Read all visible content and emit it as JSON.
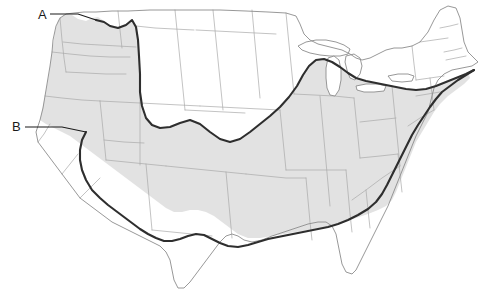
{
  "figure": {
    "kind": "reference-map",
    "region": "contiguous-united-states",
    "background_color": "#ffffff",
    "width": 489,
    "height": 303
  },
  "legend_labels": [
    {
      "id": "A",
      "text": "A",
      "text_x": 38,
      "text_y": 19,
      "leader": "M 50 14 L 78 14 L 96 20",
      "points_to": "northern-boundary-pacific-northwest"
    },
    {
      "id": "B",
      "text": "B",
      "text_x": 12,
      "text_y": 131,
      "leader": "M 25 127 L 62 127 L 86 132",
      "points_to": "western-boundary-california-coast"
    }
  ],
  "styles": {
    "land_fill": "#ffffff",
    "shaded_region_fill": "#e2e2e2",
    "state_border_color": "#a9a9a9",
    "state_border_width": 0.7,
    "coastline_color": "#8c8c8c",
    "coastline_width": 0.9,
    "boundary_line_color": "#2e2e2e",
    "boundary_line_width": 2.1,
    "lake_fill": "#ffffff",
    "label_color": "#1a1a1a",
    "leader_line_color": "#1a1a1a",
    "leader_line_width": 1.1
  },
  "map_features": {
    "outline_name": "contiguous-us-outline",
    "outline_path": "M 36 132 L 40 120 L 43 108 L 45 96 L 47 84 L 50 66 L 52 52 L 53 40 L 56 26 L 60 18 L 66 14 L 74 13 L 84 12 L 96 12 L 112 11 L 128 11 L 150 10 L 172 10 L 196 10 L 220 10 L 246 11 L 268 12 L 286 13 L 296 16 L 300 24 L 304 34 L 310 40 L 318 44 L 326 46 L 334 48 L 342 50 L 350 54 L 356 58 L 362 60 L 370 58 L 378 54 L 386 50 L 394 48 L 402 48 L 412 46 L 420 42 L 428 32 L 434 20 L 440 10 L 448 6 L 456 8 L 460 18 L 462 30 L 464 42 L 468 52 L 474 58 L 478 62 L 472 66 L 462 68 L 452 70 L 444 74 L 438 80 L 434 88 L 432 96 L 430 104 L 428 112 L 424 120 L 420 128 L 416 136 L 412 146 L 408 156 L 404 166 L 400 176 L 396 186 L 392 196 L 388 206 L 384 214 L 380 222 L 376 230 L 372 238 L 368 246 L 364 254 L 360 262 L 356 270 L 352 274 L 346 272 L 342 264 L 340 254 L 338 244 L 336 234 L 332 226 L 326 222 L 318 222 L 308 224 L 296 228 L 284 232 L 272 236 L 262 240 L 252 242 L 244 240 L 238 236 L 232 234 L 226 236 L 220 242 L 214 250 L 208 258 L 202 266 L 196 274 L 190 282 L 184 288 L 178 288 L 174 280 L 172 270 L 170 260 L 166 252 L 160 246 L 152 242 L 144 238 L 136 234 L 128 230 L 120 226 L 112 222 L 104 216 L 96 210 L 88 204 L 80 198 L 74 190 L 68 182 L 62 174 L 56 166 L 50 158 L 44 150 L 38 142 Z",
    "shaded_region_label": "shaded-climate-zone",
    "shaded_region_path": "M 40 120 L 45 96 L 49 74 L 52 52 L 55 32 L 58 20 L 64 15 L 72 15 L 78 19 L 86 21 L 92 18 L 98 17 L 104 21 L 110 25 L 118 27 L 126 24 L 132 20 L 136 26 L 138 38 L 139 54 L 140 72 L 140 90 L 141 104 L 144 116 L 150 124 L 158 128 L 168 128 L 178 124 L 188 120 L 198 122 L 208 130 L 218 138 L 228 142 L 238 140 L 248 134 L 258 126 L 268 118 L 278 110 L 288 100 L 296 88 L 302 76 L 308 66 L 314 60 L 322 58 L 330 60 L 338 64 L 346 70 L 354 76 L 362 80 L 372 82 L 382 84 L 392 86 L 400 88 L 410 90 L 420 90 L 430 88 L 440 84 L 450 80 L 460 76 L 468 72 L 470 78 L 464 84 L 456 90 L 448 96 L 440 104 L 434 112 L 428 122 L 422 132 L 416 142 L 412 152 L 408 162 L 404 172 L 400 182 L 396 192 L 392 200 L 386 206 L 378 210 L 368 214 L 356 218 L 344 222 L 332 226 L 320 228 L 308 230 L 296 232 L 284 234 L 272 236 L 260 238 L 248 238 L 238 234 L 230 228 L 222 222 L 214 216 L 206 212 L 198 210 L 190 210 L 182 212 L 174 212 L 166 208 L 158 202 L 150 196 L 142 190 L 134 184 L 126 178 L 118 172 L 110 166 L 102 160 L 94 154 L 86 148 L 78 142 L 70 136 L 62 132 L 54 128 L 46 124 Z",
    "boundary_line_label": "climate-boundary-line",
    "boundary_line_path": "M 96 20 L 104 22 L 110 26 L 118 28 L 126 25 L 132 20 L 136 27 L 138 40 L 139 56 L 140 74 L 140 92 L 142 106 L 146 118 L 152 125 L 160 128 L 170 127 L 180 123 L 190 120 L 200 124 L 210 132 L 220 139 L 230 142 L 240 139 L 250 132 L 260 124 L 270 116 L 280 107 L 289 97 L 297 86 L 303 75 L 309 66 L 316 60 L 324 59 L 332 62 L 340 67 L 348 73 L 356 78 L 366 81 L 376 83 L 386 85 L 396 87 L 406 89 L 416 90 L 426 89 L 436 86 L 446 82 L 456 78 L 466 74 L 474 70",
    "boundary_line_west_path": "M 86 132 L 82 140 L 80 150 L 80 160 L 82 170 L 86 180 L 92 190 L 100 198 L 108 205 L 116 211 L 124 217 L 132 223 L 140 229 L 148 234 L 156 238 L 164 241 L 172 241 L 180 239 L 188 236 L 196 234 L 204 235 L 212 239 L 220 243 L 228 246 L 238 247 L 248 245 L 258 242 L 268 239 L 278 237 L 288 235 L 298 233 L 308 231 L 318 229 L 328 227 L 338 224 L 348 220 L 358 215 L 368 209 L 376 202 L 382 194 L 387 185 L 392 175 L 397 165 L 402 155 L 407 145 L 412 135 L 418 125 L 424 116 L 430 107 L 436 99 L 442 92 L 450 86 L 458 80 L 466 75 L 474 70",
    "great_lakes": [
      {
        "name": "lake-superior",
        "path": "M 298 46 L 306 42 L 316 40 L 326 40 L 336 42 L 344 45 L 350 49 L 348 54 L 340 56 L 330 56 L 320 55 L 310 53 L 302 50 Z"
      },
      {
        "name": "lake-michigan",
        "path": "M 328 58 L 334 56 L 339 60 L 341 70 L 341 80 L 339 90 L 335 96 L 330 95 L 327 88 L 326 78 L 326 68 Z"
      },
      {
        "name": "lake-huron",
        "path": "M 346 56 L 354 54 L 360 58 L 362 66 L 360 74 L 355 80 L 350 78 L 347 70 L 345 62 Z"
      },
      {
        "name": "lake-erie",
        "path": "M 356 86 L 366 84 L 378 84 L 386 86 L 384 91 L 374 92 L 364 92 L 357 90 Z"
      },
      {
        "name": "lake-ontario",
        "path": "M 388 76 L 398 74 L 408 74 L 414 76 L 412 81 L 402 82 L 392 81 Z"
      }
    ],
    "state_borders_label": "state-boundaries",
    "state_border_paths": [
      "M 60 18 L 62 40 L 64 58 L 66 72",
      "M 52 52 L 70 54 L 90 56 L 110 57 L 130 57",
      "M 66 72 L 86 73 L 106 74 L 126 74",
      "M 45 96 L 62 98 L 82 100 L 100 101",
      "M 100 101 L 102 120 L 104 140 L 106 160",
      "M 100 101 L 120 102 L 140 103",
      "M 140 72 L 140 103 L 140 135 L 140 165",
      "M 106 160 L 126 162 L 146 164 L 166 166",
      "M 63 42 L 82 44 L 100 45 L 118 46 L 136 47",
      "M 118 11 L 120 30 L 122 48",
      "M 136 26 L 155 28 L 174 29 L 194 30",
      "M 140 103 L 160 104 L 180 105 L 200 106",
      "M 175 10 L 177 30 L 179 50 L 181 70 L 183 90 L 185 110",
      "M 213 10 L 215 30 L 217 50 L 219 70 L 221 90 L 223 110",
      "M 185 110 L 205 111 L 225 112 L 245 113",
      "M 166 166 L 186 168 L 206 170 L 226 172 L 246 174",
      "M 146 164 L 148 186 L 150 208 L 152 230",
      "M 196 30 L 216 31 L 236 32 L 256 33 L 276 34",
      "M 200 106 L 220 107 L 240 108 L 260 109 L 280 110",
      "M 252 10 L 254 32 L 256 54 L 258 76 L 260 98",
      "M 280 110 L 282 130 L 284 150 L 286 170",
      "M 246 174 L 266 176 L 286 178 L 306 178",
      "M 226 172 L 228 194 L 230 216 L 232 238",
      "M 286 13 L 288 34 L 290 54 L 292 74 L 294 94",
      "M 286 170 L 306 170 L 326 170 L 346 170",
      "M 294 94 L 314 95 L 334 96 L 354 98",
      "M 306 178 L 308 200 L 310 222 L 312 240",
      "M 320 96 L 322 118 L 324 140 L 326 162 L 328 184 L 330 206",
      "M 346 170 L 348 192 L 350 214 L 352 232",
      "M 354 98 L 356 118 L 358 138 L 360 158",
      "M 360 158 L 380 156 L 398 154",
      "M 360 122 L 378 120 L 396 118",
      "M 392 86 L 394 106 L 396 126 L 398 146 L 400 166",
      "M 398 154 L 400 174 L 402 192",
      "M 400 166 L 382 178 L 366 190 L 352 200",
      "M 366 190 L 368 210 L 370 228",
      "M 412 46 L 414 64 L 416 80",
      "M 416 80 L 430 78 L 444 76",
      "M 430 78 L 432 94 L 434 110",
      "M 416 96 L 428 94 L 440 92",
      "M 420 42 L 434 40 L 448 38",
      "M 434 110 L 420 118 L 408 126",
      "M 440 28 L 450 26 L 458 24",
      "M 444 52 L 454 50 L 462 48",
      "M 446 60 L 456 58 L 466 56",
      "M 38 142 L 44 134 L 50 124",
      "M 62 174 L 70 164 L 78 154",
      "M 80 198 L 90 188 L 100 178",
      "M 104 140 L 124 142 L 144 143",
      "M 152 230 L 172 232 L 192 234 L 212 236"
    ]
  }
}
